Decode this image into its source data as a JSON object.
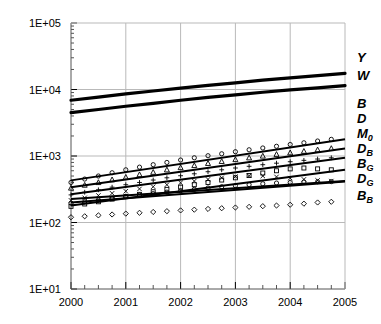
{
  "chart_data": {
    "type": "line",
    "title": "",
    "xlabel": "",
    "ylabel": "",
    "yscale": "log",
    "xlim": [
      2000,
      2005
    ],
    "ylim": [
      10,
      100000
    ],
    "grid": true,
    "legend_position": "right",
    "x_ticks": [
      "2000",
      "2001",
      "2002",
      "2003",
      "2004",
      "2005"
    ],
    "x_tick_values": [
      2000,
      2001,
      2002,
      2003,
      2004,
      2005
    ],
    "x_minor_ticks_per_interval": 4,
    "y_ticks": [
      "1E+01",
      "1E+02",
      "1E+03",
      "1E+04",
      "1E+05"
    ],
    "y_tick_values": [
      10,
      100,
      1000,
      10000,
      100000
    ],
    "series": [
      {
        "name": "Y",
        "label": "Y",
        "sub": "",
        "marker": "none",
        "style": "thick-line",
        "color": "#000000",
        "width": 3.2,
        "legend_y": 57,
        "x": [
          2000,
          2000.5,
          2001,
          2001.5,
          2002,
          2002.5,
          2003,
          2003.5,
          2004,
          2004.5,
          2005
        ],
        "values": [
          6900,
          7700,
          8600,
          9500,
          10500,
          11500,
          12600,
          13800,
          15000,
          16200,
          17500
        ]
      },
      {
        "name": "W",
        "label": "W",
        "sub": "",
        "marker": "none",
        "style": "thick-line",
        "color": "#000000",
        "width": 3.2,
        "legend_y": 75,
        "x": [
          2000,
          2000.5,
          2001,
          2001.5,
          2002,
          2002.5,
          2003,
          2003.5,
          2004,
          2004.5,
          2005
        ],
        "values": [
          4500,
          5000,
          5600,
          6200,
          6900,
          7600,
          8300,
          9100,
          9900,
          10600,
          11400
        ]
      },
      {
        "name": "B",
        "label": "B",
        "sub": "",
        "marker": "circle",
        "style": "markers+line",
        "color": "#000000",
        "width": 2.0,
        "legend_y": 103,
        "x": [
          2000,
          2000.25,
          2000.5,
          2000.75,
          2001,
          2001.25,
          2001.5,
          2001.75,
          2002,
          2002.25,
          2002.5,
          2002.75,
          2003,
          2003.25,
          2003.5,
          2003.75,
          2004,
          2004.25,
          2004.5,
          2004.75
        ],
        "values": [
          400,
          450,
          500,
          560,
          620,
          680,
          740,
          800,
          870,
          940,
          1010,
          1080,
          1160,
          1240,
          1320,
          1400,
          1490,
          1580,
          1680,
          1780
        ]
      },
      {
        "name": "D",
        "label": "D",
        "sub": "",
        "marker": "triangle",
        "style": "markers+line",
        "color": "#000000",
        "width": 2.0,
        "legend_y": 118,
        "x": [
          2000,
          2000.25,
          2000.5,
          2000.75,
          2001,
          2001.25,
          2001.5,
          2001.75,
          2002,
          2002.25,
          2002.5,
          2002.75,
          2003,
          2003.25,
          2003.5,
          2003.75,
          2004,
          2004.25,
          2004.5,
          2004.75
        ],
        "values": [
          330,
          365,
          400,
          440,
          480,
          525,
          570,
          620,
          670,
          720,
          775,
          830,
          885,
          940,
          1000,
          1060,
          1120,
          1180,
          1240,
          1300
        ]
      },
      {
        "name": "M0",
        "label": "M",
        "sub": "0",
        "marker": "plus",
        "style": "markers+line",
        "color": "#000000",
        "width": 2.0,
        "legend_y": 133,
        "x": [
          2000,
          2000.25,
          2000.5,
          2000.75,
          2001,
          2001.25,
          2001.5,
          2001.75,
          2002,
          2002.25,
          2002.5,
          2002.75,
          2003,
          2003.25,
          2003.5,
          2003.75,
          2004,
          2004.25,
          2004.5,
          2004.75
        ],
        "values": [
          260,
          285,
          310,
          340,
          370,
          400,
          435,
          470,
          505,
          540,
          580,
          620,
          660,
          700,
          740,
          780,
          820,
          860,
          900,
          940
        ]
      },
      {
        "name": "DB",
        "label": "D",
        "sub": "B",
        "marker": "square",
        "style": "markers+line",
        "color": "#000000",
        "width": 2.0,
        "legend_y": 148,
        "x": [
          2000,
          2000.25,
          2000.5,
          2000.75,
          2001,
          2001.25,
          2001.5,
          2001.75,
          2002,
          2002.25,
          2002.5,
          2002.75,
          2003,
          2003.25,
          2003.5,
          2003.75,
          2004,
          2004.25,
          2004.5,
          2004.75
        ],
        "values": [
          175,
          190,
          205,
          225,
          245,
          265,
          290,
          315,
          340,
          370,
          400,
          435,
          470,
          510,
          555,
          600,
          640,
          660,
          640,
          620
        ]
      },
      {
        "name": "BG",
        "label": "B",
        "sub": "G",
        "marker": "cross",
        "style": "markers+line",
        "color": "#000000",
        "width": 2.0,
        "legend_y": 163,
        "x": [
          2000,
          2000.25,
          2000.5,
          2000.75,
          2001,
          2001.25,
          2001.5,
          2001.75,
          2002,
          2002.25,
          2002.5,
          2002.75,
          2003,
          2003.25,
          2003.5,
          2003.75,
          2004,
          2004.25,
          2004.5,
          2004.75
        ],
        "values": [
          215,
          235,
          255,
          275,
          295,
          320,
          345,
          370,
          395,
          420,
          445,
          470,
          490,
          505,
          500,
          485,
          465,
          445,
          430,
          420
        ]
      },
      {
        "name": "DG",
        "label": "D",
        "sub": "G",
        "marker": "circle",
        "style": "markers+line",
        "color": "#000000",
        "width": 2.0,
        "legend_y": 178,
        "x": [
          2000,
          2000.25,
          2000.5,
          2000.75,
          2001,
          2001.25,
          2001.5,
          2001.75,
          2002,
          2002.25,
          2002.5,
          2002.75,
          2003,
          2003.25,
          2003.5,
          2003.75,
          2004,
          2004.25,
          2004.5,
          2004.75
        ],
        "values": [
          195,
          205,
          218,
          230,
          245,
          258,
          272,
          286,
          300,
          315,
          330,
          345,
          358,
          370,
          382,
          392,
          400,
          406,
          410,
          412
        ]
      },
      {
        "name": "BB",
        "label": "B",
        "sub": "B",
        "marker": "diamond",
        "style": "markers+line",
        "color": "#000000",
        "width": 2.0,
        "legend_y": 195,
        "x": [
          2000,
          2000.25,
          2000.5,
          2000.75,
          2001,
          2001.25,
          2001.5,
          2001.75,
          2002,
          2002.25,
          2002.5,
          2002.75,
          2003,
          2003.25,
          2003.5,
          2003.75,
          2004,
          2004.25,
          2004.5,
          2004.75
        ],
        "values": [
          120,
          124,
          128,
          132,
          136,
          140,
          144,
          148,
          152,
          156,
          160,
          164,
          168,
          172,
          176,
          180,
          185,
          192,
          200,
          205
        ]
      }
    ],
    "extra_straight_lines": [
      {
        "name": "fit-B",
        "x0": 2000,
        "y0": 430,
        "x1": 2005,
        "y1": 1780
      },
      {
        "name": "fit-D",
        "x0": 2000,
        "y0": 340,
        "x1": 2005,
        "y1": 1300
      },
      {
        "name": "fit-M0",
        "x0": 2000,
        "y0": 265,
        "x1": 2005,
        "y1": 940
      },
      {
        "name": "fit-DB",
        "x0": 2000,
        "y0": 180,
        "x1": 2005,
        "y1": 620
      },
      {
        "name": "fit-BG",
        "x0": 2000,
        "y0": 225,
        "x1": 2005,
        "y1": 420
      },
      {
        "name": "fit-DG",
        "x0": 2000,
        "y0": 200,
        "x1": 2005,
        "y1": 412
      }
    ]
  }
}
